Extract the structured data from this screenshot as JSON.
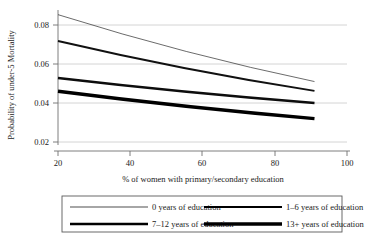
{
  "chart_data": {
    "type": "line",
    "title": "",
    "xlabel": "% of women with primary/secondary education",
    "ylabel": "Probability of under-5 Mortality",
    "xlim": [
      15,
      105
    ],
    "ylim": [
      0.015,
      0.0875
    ],
    "xticks": [
      20,
      40,
      60,
      80,
      100
    ],
    "xticklabels": [
      "20",
      "40",
      "60",
      "80",
      "100"
    ],
    "yticks": [
      0.02,
      0.04,
      0.06,
      0.08
    ],
    "yticklabels": [
      "0.02",
      "0.04",
      "0.06",
      "0.08"
    ],
    "grid": "horizontal",
    "legend_position": "below-axes",
    "x": [
      20,
      91
    ],
    "series": [
      {
        "name": "0 years of education",
        "values": [
          0.0853,
          0.051
        ],
        "linewidth": 0.7,
        "color": "#2b2b2b"
      },
      {
        "name": "1–6 years of education",
        "values": [
          0.0718,
          0.0462
        ],
        "linewidth": 1.9,
        "color": "#111111"
      },
      {
        "name": "7–12 years of education",
        "values": [
          0.0528,
          0.04
        ],
        "linewidth": 2.6,
        "color": "#0d0d0d"
      },
      {
        "name": "13+ years of education",
        "values": [
          0.046,
          0.032
        ],
        "linewidth": 3.4,
        "color": "#000000"
      }
    ]
  },
  "legend": {
    "entries": [
      {
        "label": "0 years of education",
        "linewidth": 0.7
      },
      {
        "label": "1–6 years of education",
        "linewidth": 1.9
      },
      {
        "label": "7–12 years of education",
        "linewidth": 2.6
      },
      {
        "label": "13+ years of education",
        "linewidth": 3.4
      }
    ]
  },
  "colors": {
    "ink": "#1a1a1a",
    "grid": "#c8c8c8",
    "axis": "#6f6f6f",
    "legend_border": "#5a5a5a",
    "background": "#ffffff"
  }
}
